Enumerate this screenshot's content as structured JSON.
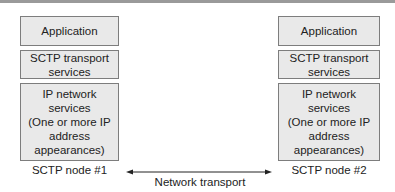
{
  "diagram": {
    "nodes": [
      {
        "name": "SCTP node #1",
        "layers": [
          {
            "label": "Application"
          },
          {
            "label": "SCTP transport\nservices"
          },
          {
            "label": "IP network\nservices\n(One or more IP\naddress\nappearances)"
          }
        ]
      },
      {
        "name": "SCTP node #2",
        "layers": [
          {
            "label": "Application"
          },
          {
            "label": "SCTP transport\nservices"
          },
          {
            "label": "IP network\nservices\n(One or more IP\naddress\nappearances)"
          }
        ]
      }
    ],
    "link": {
      "label": "Network transport",
      "direction": "bidirectional"
    },
    "colors": {
      "box_fill": "#e9e9e9",
      "box_border": "#7d7d7d",
      "line": "#222222"
    }
  }
}
